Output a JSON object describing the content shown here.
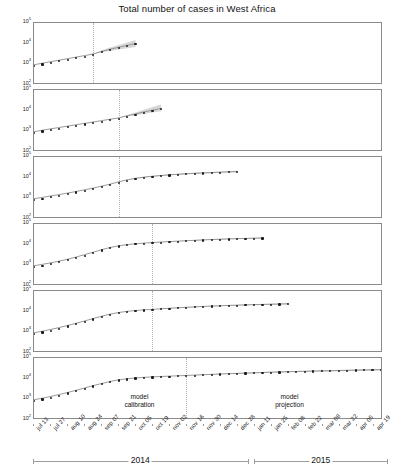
{
  "chart_data": {
    "type": "line",
    "title": "Total number of cases in West Africa",
    "xlabel": "",
    "ylabel": "",
    "yscale": "log",
    "ylim": [
      100,
      100000
    ],
    "ytick_labels": [
      "10",
      "10",
      "10",
      "10"
    ],
    "ytick_exponents": [
      "5",
      "4",
      "3",
      "2"
    ],
    "ytick_values": [
      100000,
      10000,
      1000,
      100
    ],
    "grid": false,
    "legend": "none",
    "x_start_label": "jul 13",
    "x_end_label": "apr 19",
    "x": [
      "jul 13",
      "jul 27",
      "aug 10",
      "aug 24",
      "sep 07",
      "sep 21",
      "oct 05",
      "oct 19",
      "nov 02",
      "nov 16",
      "nov 30",
      "dec 14",
      "dec 28",
      "jan 11",
      "jan 25",
      "feb 08",
      "feb 22",
      "mar 08",
      "mar 22",
      "apr 05",
      "apr 19"
    ],
    "years": [
      {
        "label": "2014",
        "start": "jul 13",
        "end": "dec 28"
      },
      {
        "label": "2015",
        "start": "jan 11",
        "end": "apr 19"
      }
    ],
    "annotations": [
      {
        "line1": "model",
        "line2": "calibration"
      },
      {
        "line1": "model",
        "line2": "projection"
      }
    ],
    "band_color": "#c9c9c9",
    "point_color": "#1c1c1c",
    "line_color": "#8f8f8f",
    "divider_color": "#b4b4b4",
    "panels": [
      {
        "name": "panel-1",
        "calibration_end_index": 7,
        "data_end_index": 12,
        "values": [
          820,
          980,
          1170,
          1390,
          1660,
          1980,
          2360,
          2820,
          3800,
          4900,
          6100,
          7600,
          9300
        ],
        "band_lower": [
          820,
          980,
          1170,
          1390,
          1660,
          1980,
          2360,
          2820,
          3400,
          4000,
          4700,
          5500,
          6400
        ],
        "band_upper": [
          820,
          980,
          1170,
          1390,
          1660,
          1980,
          2360,
          2820,
          4300,
          6000,
          8000,
          10600,
          14000
        ]
      },
      {
        "name": "panel-2",
        "calibration_end_index": 10,
        "data_end_index": 15,
        "values": [
          820,
          980,
          1150,
          1340,
          1570,
          1840,
          2150,
          2520,
          2950,
          3450,
          4050,
          5100,
          6400,
          8000,
          9900,
          12000
        ],
        "band_lower": [
          820,
          980,
          1150,
          1340,
          1570,
          1840,
          2150,
          2520,
          2950,
          3450,
          4050,
          4700,
          5500,
          6400,
          7400,
          8600
        ],
        "band_upper": [
          820,
          980,
          1150,
          1340,
          1570,
          1840,
          2150,
          2520,
          2950,
          3450,
          4050,
          5600,
          7600,
          10400,
          14000,
          19000
        ]
      },
      {
        "name": "panel-3",
        "calibration_end_index": 10,
        "data_end_index": 24,
        "values": [
          820,
          960,
          1130,
          1330,
          1580,
          1900,
          2300,
          2800,
          3500,
          4400,
          5700,
          7200,
          8600,
          9800,
          10900,
          11900,
          12800,
          13700,
          14500,
          15300,
          16000,
          16700,
          17400,
          18100,
          18800
        ],
        "band_lower": [
          820,
          960,
          1130,
          1330,
          1580,
          1900,
          2300,
          2800,
          3500,
          4400,
          5700,
          7000,
          8300,
          9400,
          10400,
          11300,
          12100,
          12900,
          13600,
          14300,
          15000,
          15600,
          16200,
          16800,
          17400
        ],
        "band_upper": [
          820,
          960,
          1130,
          1330,
          1580,
          1900,
          2300,
          2800,
          3500,
          4400,
          5700,
          7400,
          8900,
          10200,
          11400,
          12500,
          13500,
          14500,
          15400,
          16300,
          17100,
          17900,
          18700,
          19500,
          20300
        ]
      },
      {
        "name": "panel-4",
        "calibration_end_index": 14,
        "data_end_index": 27,
        "values": [
          820,
          960,
          1150,
          1400,
          1750,
          2250,
          2950,
          3900,
          5200,
          6700,
          8100,
          9300,
          10300,
          11100,
          11800,
          12500,
          13200,
          13900,
          14600,
          15300,
          16000,
          16700,
          17300,
          17900,
          18500,
          19000,
          19500,
          20000
        ],
        "band_lower": [
          820,
          960,
          1150,
          1400,
          1750,
          2250,
          2950,
          3900,
          5200,
          6700,
          8100,
          9300,
          10300,
          11100,
          11800,
          12400,
          13000,
          13700,
          14300,
          14900,
          15500,
          16100,
          16700,
          17200,
          17700,
          18200,
          18700,
          19100
        ],
        "band_upper": [
          820,
          960,
          1150,
          1400,
          1750,
          2250,
          2950,
          3900,
          5200,
          6700,
          8100,
          9300,
          10300,
          11100,
          11800,
          12600,
          13400,
          14200,
          15000,
          15800,
          16600,
          17400,
          18100,
          18800,
          19500,
          20100,
          20700,
          21300
        ]
      },
      {
        "name": "panel-5",
        "calibration_end_index": 14,
        "data_end_index": 30,
        "values": [
          820,
          980,
          1200,
          1500,
          1900,
          2450,
          3200,
          4200,
          5500,
          7000,
          8400,
          9600,
          10600,
          11400,
          12100,
          12900,
          13700,
          14500,
          15300,
          16100,
          16900,
          17600,
          18300,
          19000,
          19600,
          20200,
          20800,
          21300,
          21800,
          22300,
          22800
        ],
        "band_lower": [
          820,
          980,
          1200,
          1500,
          1900,
          2450,
          3200,
          4200,
          5500,
          7000,
          8400,
          9600,
          10600,
          11400,
          12100,
          12800,
          13500,
          14200,
          14900,
          15600,
          16300,
          17000,
          17600,
          18200,
          18800,
          19300,
          19800,
          20300,
          20800,
          21200,
          21600
        ],
        "band_upper": [
          820,
          980,
          1200,
          1500,
          1900,
          2450,
          3200,
          4200,
          5500,
          7000,
          8400,
          9600,
          10600,
          11400,
          12100,
          13000,
          13900,
          14800,
          15700,
          16600,
          17500,
          18300,
          19100,
          19900,
          20600,
          21300,
          22000,
          22600,
          23200,
          23800,
          24300
        ]
      },
      {
        "name": "panel-6",
        "calibration_end_index": 18,
        "data_end_index": 41,
        "values": [
          820,
          980,
          1200,
          1500,
          1900,
          2450,
          3200,
          4150,
          5300,
          6700,
          8100,
          9200,
          10100,
          10800,
          11400,
          11900,
          12400,
          12900,
          13400,
          14000,
          14600,
          15200,
          15800,
          16400,
          17000,
          17600,
          18200,
          18800,
          19400,
          20000,
          20600,
          21100,
          21600,
          22100,
          22600,
          23100,
          23600,
          24100,
          24600,
          25100,
          25600,
          26200
        ],
        "band_lower": [
          820,
          980,
          1200,
          1500,
          1900,
          2450,
          3200,
          4150,
          5300,
          6700,
          8100,
          9200,
          10100,
          10800,
          11400,
          11900,
          12400,
          12900,
          13400,
          13900,
          14400,
          14900,
          15400,
          15900,
          16400,
          16900,
          17400,
          17900,
          18400,
          18900,
          19400,
          19800,
          20200,
          20600,
          21000,
          21400,
          21800,
          22200,
          22600,
          23000,
          23400,
          23800
        ],
        "band_upper": [
          820,
          980,
          1200,
          1500,
          1900,
          2450,
          3200,
          4150,
          5300,
          6700,
          8100,
          9200,
          10100,
          10800,
          11400,
          11900,
          12400,
          12900,
          13400,
          14100,
          14800,
          15500,
          16200,
          16900,
          17600,
          18300,
          19000,
          19700,
          20400,
          21100,
          21800,
          22400,
          23000,
          23600,
          24200,
          24800,
          25400,
          26000,
          26600,
          27200,
          27800,
          28400
        ]
      }
    ]
  }
}
